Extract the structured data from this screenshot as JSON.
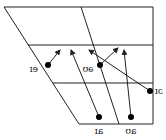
{
  "diagram": {
    "frame": {
      "top_left": [
        4,
        7
      ],
      "top_right": [
        153,
        7
      ],
      "bottom_right": [
        153,
        124
      ],
      "bottom_left": [
        79,
        124
      ],
      "h_lines": [
        [
          28,
          45,
          153,
          45
        ],
        [
          53,
          83,
          153,
          83
        ]
      ],
      "v_line": [
        81,
        7,
        119,
        124
      ]
    },
    "diphthongs": [
      {
        "label": "eɪ",
        "dot": [
          48,
          65
        ],
        "arrow_to": [
          60,
          50
        ],
        "label_pos": [
          34,
          72
        ]
      },
      {
        "label": "əʊ",
        "dot": [
          100,
          65
        ],
        "arrow_to": [
          118,
          48
        ],
        "label_pos": [
          88,
          72
        ]
      },
      {
        "label": "ɔɪ",
        "dot": [
          150,
          91
        ],
        "arrow_to": [
          89,
          50
        ],
        "label_pos": [
          159,
          94
        ]
      },
      {
        "label": "aɪ",
        "dot": [
          99,
          117
        ],
        "arrow_to": [
          71,
          50
        ],
        "label_pos": [
          99,
          134
        ]
      },
      {
        "label": "aʊ",
        "dot": [
          131,
          117
        ],
        "arrow_to": [
          124,
          50
        ],
        "label_pos": [
          131,
          134
        ]
      }
    ],
    "colors": {
      "line": "#222222",
      "dot": "#000000",
      "background": "#ffffff"
    }
  }
}
